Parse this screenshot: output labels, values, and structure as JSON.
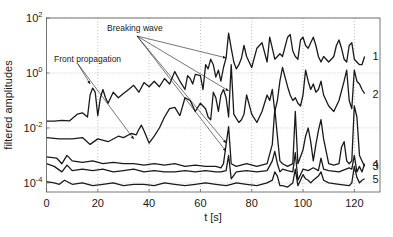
{
  "chart_data": {
    "type": "line",
    "title": "",
    "xlabel": "t  [s]",
    "ylabel": "filtered amplitudes",
    "xlim": [
      0,
      130
    ],
    "ylim_log10": [
      -4.33,
      2
    ],
    "yscale": "log",
    "grid": true,
    "x_ticks": [
      0,
      20,
      40,
      60,
      80,
      100,
      120
    ],
    "x_tick_labels": [
      "0",
      "20",
      "40",
      "60",
      "80",
      "100",
      "120"
    ],
    "y_ticks_log10": [
      2,
      0,
      -2,
      -4
    ],
    "y_tick_labels": [
      {
        "base": "10",
        "exp": "2"
      },
      {
        "base": "10",
        "exp": "0"
      },
      {
        "base": "10",
        "exp": "-2"
      },
      {
        "base": "10",
        "exp": "-4"
      }
    ],
    "annotations": [
      {
        "text": "Breaking wave",
        "arrow_targets": [
          [
            70,
            0.55
          ],
          [
            71,
            -0.65
          ],
          [
            70,
            -2.55
          ],
          [
            70,
            -2.85
          ]
        ]
      },
      {
        "text": "Front propagation",
        "arrow_targets": [
          [
            17,
            -0.4
          ],
          [
            34,
            -2.4
          ]
        ]
      }
    ],
    "series": [
      {
        "name": "1",
        "t": [
          0,
          3,
          6,
          9,
          12,
          14,
          16,
          17,
          18,
          19,
          20,
          21,
          22,
          23,
          24,
          26,
          28,
          30,
          32,
          34,
          36,
          38,
          40,
          42,
          44,
          46,
          48,
          50,
          52,
          54,
          55,
          56,
          57,
          58,
          60,
          61,
          62,
          63,
          64,
          65,
          66,
          67,
          68,
          69,
          70,
          71,
          72,
          73,
          74,
          75,
          76,
          77,
          78,
          80,
          82,
          84,
          86,
          87,
          88,
          89,
          90,
          91,
          92,
          94,
          95,
          96,
          97,
          98,
          99,
          100,
          101,
          102,
          103,
          104,
          105,
          106,
          107,
          108,
          110,
          111,
          112,
          113,
          114,
          115,
          116,
          117,
          118,
          119,
          120,
          121,
          122,
          123,
          124
        ],
        "log10_value": [
          -1.75,
          -1.75,
          -1.72,
          -1.74,
          -1.5,
          -1.45,
          -1.6,
          -0.8,
          -0.55,
          -0.7,
          -1.55,
          -0.9,
          -0.6,
          -0.9,
          -1.1,
          -0.7,
          -0.9,
          -0.75,
          -0.6,
          -0.45,
          -0.7,
          -0.35,
          -0.5,
          -0.3,
          -0.5,
          -0.2,
          -0.4,
          0.05,
          -0.3,
          -0.6,
          -0.1,
          -0.2,
          -0.4,
          -0.05,
          -0.1,
          -0.6,
          0.3,
          0.15,
          0.5,
          0.3,
          -0.15,
          0.1,
          -0.3,
          0.2,
          0.55,
          1.45,
          0.9,
          0.4,
          0.15,
          0.3,
          0.55,
          1.0,
          0.6,
          0.2,
          0.9,
          1.1,
          0.4,
          1.3,
          0.9,
          0.5,
          0.6,
          0.7,
          0.6,
          1.3,
          1.4,
          0.8,
          0.6,
          0.5,
          1.2,
          1.3,
          1.0,
          0.9,
          1.1,
          1.3,
          1.0,
          0.6,
          0.4,
          0.6,
          0.4,
          0.5,
          0.6,
          1.0,
          1.2,
          0.9,
          0.5,
          0.4,
          1.0,
          1.1,
          0.5,
          0.4,
          0.3,
          0.3,
          0.6
        ]
      },
      {
        "name": "2",
        "t": [
          0,
          5,
          10,
          14,
          17,
          20,
          24,
          28,
          30,
          33,
          35,
          36,
          37,
          38,
          40,
          42,
          44,
          46,
          48,
          50,
          52,
          54,
          56,
          58,
          60,
          62,
          63,
          64,
          65,
          66,
          67,
          68,
          69,
          70,
          71,
          72,
          73,
          74,
          75,
          76,
          77,
          78,
          80,
          82,
          84,
          86,
          87,
          88,
          89,
          90,
          91,
          92,
          94,
          95,
          96,
          97,
          98,
          99,
          100,
          101,
          102,
          103,
          104,
          105,
          106,
          107,
          108,
          110,
          112,
          114,
          116,
          117,
          118,
          119,
          120,
          121,
          122,
          123,
          124
        ],
        "log10_value": [
          -2.35,
          -2.4,
          -2.4,
          -2.35,
          -2.6,
          -2.4,
          -2.5,
          -2.3,
          -2.35,
          -2.2,
          -2.25,
          -2.05,
          -1.9,
          -2.1,
          -2.55,
          -2.3,
          -2.0,
          -1.6,
          -1.3,
          -1.25,
          -1.55,
          -0.9,
          -1.0,
          -1.4,
          -1.1,
          -1.3,
          -1.6,
          -1.7,
          -0.7,
          -0.9,
          -1.4,
          -0.8,
          -0.6,
          -0.9,
          -1.6,
          0.3,
          -1.5,
          -1.65,
          -1.8,
          -1.7,
          -1.5,
          -0.8,
          -1.5,
          -1.8,
          -1.4,
          -0.8,
          -1.0,
          -0.6,
          -1.4,
          -1.0,
          -0.3,
          0.2,
          -0.5,
          -0.8,
          -1.0,
          -0.9,
          -1.1,
          -1.2,
          -0.8,
          0.1,
          -0.3,
          -0.6,
          -0.4,
          -0.7,
          -0.6,
          -0.3,
          -0.8,
          -1.2,
          -1.4,
          -1.0,
          -0.3,
          0.1,
          -1.0,
          -1.3,
          0.1,
          -0.3,
          -0.4,
          -0.6,
          -0.75
        ]
      },
      {
        "name": "3",
        "t": [
          0,
          4,
          6,
          8,
          10,
          14,
          18,
          22,
          26,
          30,
          34,
          38,
          42,
          46,
          50,
          54,
          58,
          62,
          66,
          68,
          69,
          70,
          71,
          72,
          74,
          78,
          82,
          86,
          88,
          89,
          90,
          91,
          92,
          94,
          96,
          97,
          98,
          100,
          101,
          102,
          103,
          104,
          105,
          106,
          107,
          108,
          110,
          112,
          114,
          115,
          116,
          117,
          118,
          119,
          120,
          121,
          122,
          123,
          124
        ],
        "log10_value": [
          -3.05,
          -3.1,
          -3.3,
          -3.0,
          -3.2,
          -3.25,
          -3.2,
          -3.3,
          -3.25,
          -3.3,
          -3.3,
          -3.35,
          -3.3,
          -3.35,
          -3.3,
          -3.4,
          -3.35,
          -3.4,
          -3.4,
          -3.45,
          -3.3,
          -2.6,
          -1.95,
          -3.3,
          -3.4,
          -3.3,
          -3.4,
          -3.3,
          -2.6,
          -1.3,
          -2.3,
          -3.2,
          -3.3,
          -3.4,
          -3.3,
          -1.4,
          -3.3,
          -2.8,
          -2.3,
          -2.0,
          -2.5,
          -3.2,
          -2.6,
          -2.1,
          -1.7,
          -2.4,
          -3.3,
          -3.35,
          -3.3,
          -2.7,
          -2.5,
          -3.2,
          -3.3,
          -3.2,
          -1.2,
          -1.6,
          -3.0,
          -3.2,
          -3.4
        ]
      },
      {
        "name": "4",
        "t": [
          0,
          3,
          6,
          8,
          10,
          14,
          18,
          22,
          26,
          30,
          34,
          38,
          42,
          46,
          50,
          54,
          58,
          62,
          66,
          68,
          70,
          71,
          72,
          74,
          78,
          82,
          86,
          88,
          89,
          90,
          91,
          92,
          94,
          96,
          97,
          98,
          100,
          102,
          104,
          106,
          107,
          108,
          110,
          114,
          118,
          119,
          120,
          121,
          122,
          123,
          124
        ],
        "log10_value": [
          -3.3,
          -3.4,
          -3.6,
          -3.35,
          -3.55,
          -3.5,
          -3.55,
          -3.5,
          -3.6,
          -3.55,
          -3.5,
          -3.6,
          -3.55,
          -3.6,
          -3.6,
          -3.55,
          -3.6,
          -3.55,
          -3.6,
          -3.6,
          -3.55,
          -3.0,
          -3.85,
          -3.6,
          -3.55,
          -3.6,
          -3.55,
          -3.2,
          -2.85,
          -3.3,
          -3.6,
          -3.5,
          -3.55,
          -3.6,
          -2.9,
          -3.9,
          -3.5,
          -3.55,
          -3.45,
          -3.55,
          -3.1,
          -3.5,
          -3.55,
          -3.6,
          -3.45,
          -3.5,
          -3.0,
          -3.6,
          -3.4,
          -3.6,
          -3.3
        ]
      },
      {
        "name": "5",
        "t": [
          0,
          3,
          5,
          7,
          10,
          14,
          18,
          22,
          26,
          30,
          34,
          38,
          42,
          46,
          50,
          54,
          58,
          62,
          66,
          70,
          72,
          74,
          78,
          82,
          86,
          88,
          89,
          90,
          91,
          92,
          94,
          96,
          97,
          98,
          100,
          101,
          102,
          103,
          104,
          106,
          107,
          108,
          110,
          114,
          118,
          119,
          120,
          121,
          122,
          123,
          124
        ],
        "log10_value": [
          -3.95,
          -4.0,
          -4.05,
          -3.9,
          -4.05,
          -4.0,
          -4.1,
          -4.05,
          -4.0,
          -4.1,
          -4.05,
          -4.05,
          -4.1,
          -4.0,
          -4.05,
          -4.1,
          -4.05,
          -4.0,
          -4.05,
          -4.1,
          -4.05,
          -4.0,
          -4.05,
          -4.1,
          -4.0,
          -3.9,
          -3.6,
          -3.75,
          -4.1,
          -4.1,
          -4.15,
          -4.0,
          -3.5,
          -4.1,
          -3.7,
          -3.85,
          -3.9,
          -4.0,
          -3.9,
          -3.75,
          -3.6,
          -3.9,
          -4.0,
          -4.05,
          -4.1,
          -4.0,
          -3.4,
          -3.8,
          -4.0,
          -3.9,
          -3.85
        ]
      }
    ]
  }
}
